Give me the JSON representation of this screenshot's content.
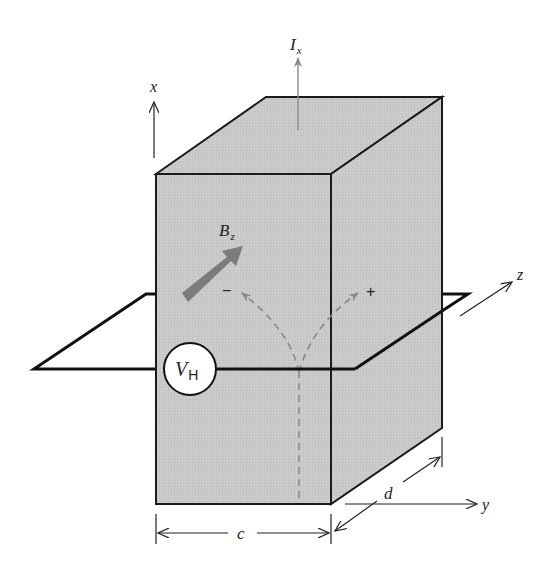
{
  "diagram": {
    "colors": {
      "box_fill": "#c8c8c8",
      "box_stroke": "#1a1a1a",
      "wire": "#111111",
      "dashed_path": "#8a8a8a",
      "b_arrow": "#7c7c7c",
      "current_arrow": "#8a8a8a",
      "background": "#ffffff"
    },
    "labels": {
      "current": {
        "main": "I",
        "sub": "x"
      },
      "magnetic_field": {
        "main": "B",
        "sub": "z"
      },
      "hall_voltage": {
        "main": "V",
        "sub": "H"
      },
      "axis_x": "x",
      "axis_y": "y",
      "axis_z": "z",
      "dim_width": "c",
      "dim_depth": "d",
      "minus_sign": "−",
      "plus_sign": "+"
    }
  }
}
